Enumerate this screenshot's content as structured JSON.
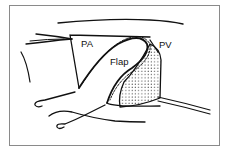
{
  "figure": {
    "labels": {
      "pa": "PA",
      "flap": "Flap",
      "pv": "PV"
    },
    "colors": {
      "frame": "#8a8a8a",
      "ink": "#111111",
      "background": "#ffffff"
    }
  }
}
